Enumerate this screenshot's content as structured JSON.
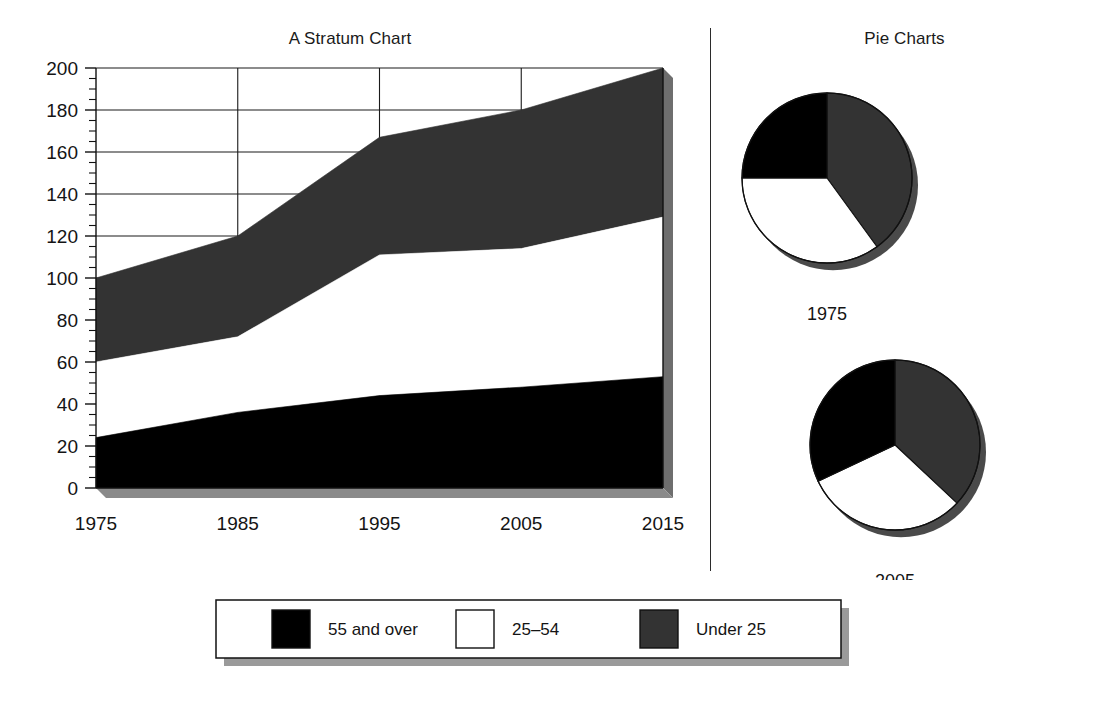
{
  "stratum": {
    "title": "A Stratum Chart"
  },
  "pies": {
    "title": "Pie Charts"
  },
  "legend": {
    "items": [
      {
        "label": "55 and over",
        "color": "#000000"
      },
      {
        "label": "25–54",
        "color": "#ffffff"
      },
      {
        "label": "Under 25",
        "color": "#333333"
      }
    ]
  },
  "chart_data": [
    {
      "type": "area",
      "title": "A Stratum Chart",
      "xlabel": "",
      "ylabel": "",
      "x": [
        1975,
        1985,
        1995,
        2005,
        2015
      ],
      "categories": [
        "1975",
        "1985",
        "1995",
        "2005",
        "2015"
      ],
      "xtick_labels": [
        "1975",
        "1985",
        "1995",
        "2005",
        "2015"
      ],
      "ytick_labels": [
        "0",
        "20",
        "40",
        "60",
        "80",
        "100",
        "120",
        "140",
        "160",
        "180",
        "200"
      ],
      "ytick_values": [
        0,
        20,
        40,
        60,
        80,
        100,
        120,
        140,
        160,
        180,
        200
      ],
      "yminor_step": 5,
      "ylim": [
        0,
        200
      ],
      "xlim": [
        1975,
        2015
      ],
      "grid": true,
      "stacked": true,
      "legend_position": "bottom",
      "series": [
        {
          "name": "55 and over",
          "color": "#000000",
          "values": [
            24,
            36,
            44,
            48,
            53
          ]
        },
        {
          "name": "25–54",
          "color": "#ffffff",
          "values": [
            36,
            36,
            67,
            66,
            76
          ]
        },
        {
          "name": "Under 25",
          "color": "#333333",
          "values": [
            40,
            48,
            56,
            66,
            71
          ]
        }
      ],
      "cumulative_tops": {
        "55 and over": [
          24,
          36,
          44,
          48,
          53
        ],
        "25–54": [
          60,
          72,
          111,
          114,
          129
        ],
        "Under 25": [
          100,
          120,
          167,
          180,
          200
        ]
      }
    },
    {
      "type": "pie",
      "title": "1975",
      "labels": [
        "Under 25",
        "25–54",
        "55 and over"
      ],
      "values": [
        40,
        35,
        25
      ],
      "colors": [
        "#333333",
        "#ffffff",
        "#000000"
      ],
      "start_angle_deg": 0
    },
    {
      "type": "pie",
      "title": "2005",
      "labels": [
        "Under 25",
        "25–54",
        "55 and over"
      ],
      "values": [
        37,
        31,
        32
      ],
      "colors": [
        "#333333",
        "#ffffff",
        "#000000"
      ],
      "start_angle_deg": 0
    }
  ]
}
